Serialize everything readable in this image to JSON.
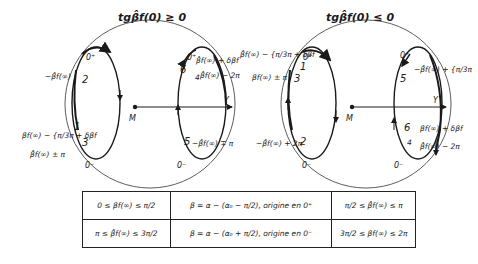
{
  "diagrams": [
    {
      "title": "tgβ̂f(0) ≥ 0",
      "points": {
        "top_left": "0⁺",
        "top_right": "0⁺",
        "bottom_left": "0⁻",
        "bottom_right": "0⁻"
      },
      "numbers": [
        "1",
        "2",
        "3",
        "5",
        "6",
        "4"
      ],
      "labels": {
        "l2": "−β̂f(∞)",
        "l13": "βf(∞) − {π/3π + δβf",
        "l3b": "β̂f(∞) ± π",
        "l6": "β̂f(∞) + δβf",
        "l4": "β̂f(∞) − 2π",
        "l5": "−β̂f(∞) ∓ π"
      },
      "axis": {
        "y_label": "Y",
        "origin_label": "M"
      }
    },
    {
      "title": "tgβ̂f(0) ≤ 0",
      "points": {
        "top_left": "0⁺",
        "top_right": "0⁺",
        "bottom_left": "0⁻",
        "bottom_right": "0⁻"
      },
      "numbers": [
        "1",
        "3",
        "2",
        "5",
        "6",
        "4"
      ],
      "labels": {
        "l1": "β̂f(∞) − {π/3π + δβf",
        "l3": "βf(∞) ± π",
        "l2": "−β̂f(∞) + 2π",
        "l5": "−β̂f(∞) + {π/3π",
        "l6": "βf(∞) + δβf",
        "l4": "β̂f(∞) − 2π"
      },
      "axis": {
        "y_label": "Y",
        "origin_label": "M"
      }
    }
  ],
  "table": {
    "rows": [
      [
        "0 ≤ βf(∞) ≤ π/2",
        "β = α − (α₀ − π/2), origine en 0⁺",
        "π/2 ≤ β̂f(∞) ≤ π"
      ],
      [
        "π ≤ β̂f(∞) ≤ 3π/2",
        "β = α − (α₀ + π/2), origine en 0⁻",
        "3π/2 ≤ βf(∞) ≤ 2π"
      ]
    ]
  }
}
